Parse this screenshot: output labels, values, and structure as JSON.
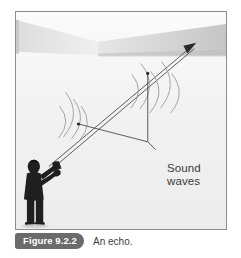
{
  "figure": {
    "tag_label": "Figure 9.2.2",
    "caption": "An echo.",
    "tag_bg_color": "#6b6b6b",
    "tag_text_color": "#ffffff",
    "caption_text_color": "#3d3d3d"
  },
  "illustration": {
    "alt_name": "echo-diagram",
    "background_color": "#f2f2f2",
    "border_color": "#8d8d8d",
    "ink_color": "#555555",
    "person_color": "#1c1c1c",
    "band_left_color": "#e2e2e2",
    "band_right_color": "#cfcfcf",
    "wall_color": "#d8d8d8",
    "labels": {
      "sound_waves": "Sound\nwaves"
    },
    "elements": [
      "outgoing-ray",
      "returning-ray",
      "wavefront-arcs",
      "shouting-person",
      "leader-lines",
      "canyon-walls"
    ]
  }
}
